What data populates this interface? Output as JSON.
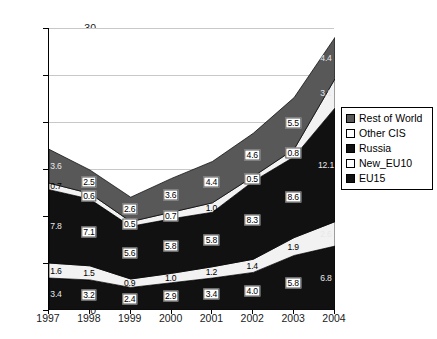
{
  "chart_data": {
    "type": "area",
    "stacked": true,
    "title": "",
    "subtitle": "",
    "xlabel": "",
    "ylabel": "",
    "categories": [
      "1997",
      "1998",
      "1999",
      "2000",
      "2001",
      "2002",
      "2003",
      "2004"
    ],
    "ylim": [
      0,
      30
    ],
    "yticks": [
      0,
      5,
      10,
      15,
      20,
      25,
      30
    ],
    "grid": true,
    "legend_position": "right",
    "series": [
      {
        "name": "EU15",
        "color": "#111111",
        "values": [
          3.4,
          3.2,
          2.4,
          2.9,
          3.4,
          4.0,
          5.8,
          6.8
        ]
      },
      {
        "name": "New_EU10",
        "color": "#f2f2f2",
        "values": [
          1.6,
          1.5,
          0.9,
          1.0,
          1.2,
          1.4,
          1.9,
          2.6
        ]
      },
      {
        "name": "Russia",
        "color": "#111111",
        "values": [
          7.8,
          7.1,
          5.6,
          5.8,
          5.8,
          8.3,
          8.6,
          12.1
        ]
      },
      {
        "name": "Other CIS",
        "color": "#f2f2f2",
        "values": [
          0.7,
          0.6,
          0.5,
          0.7,
          1.0,
          0.5,
          0.8,
          3.1
        ]
      },
      {
        "name": "Rest of World",
        "color": "#585858",
        "values": [
          3.6,
          2.5,
          2.6,
          3.6,
          4.4,
          4.6,
          5.5,
          4.4
        ]
      }
    ],
    "labels": [
      {
        "series": "Rest of World",
        "category": "1997",
        "text": "3.6",
        "style": "plain-light"
      },
      {
        "series": "Rest of World",
        "category": "1998",
        "text": "2.5",
        "style": "boxed"
      },
      {
        "series": "Rest of World",
        "category": "1999",
        "text": "2.6",
        "style": "boxed"
      },
      {
        "series": "Rest of World",
        "category": "2000",
        "text": "3.6",
        "style": "boxed"
      },
      {
        "series": "Rest of World",
        "category": "2001",
        "text": "4.4",
        "style": "boxed"
      },
      {
        "series": "Rest of World",
        "category": "2002",
        "text": "4.6",
        "style": "boxed"
      },
      {
        "series": "Rest of World",
        "category": "2003",
        "text": "5.5",
        "style": "boxed"
      },
      {
        "series": "Rest of World",
        "category": "2004",
        "text": "4.4",
        "style": "plain-light"
      },
      {
        "series": "Other CIS",
        "category": "1997",
        "text": "0.7",
        "style": "plain-dark"
      },
      {
        "series": "Other CIS",
        "category": "1998",
        "text": "0.6",
        "style": "boxed"
      },
      {
        "series": "Other CIS",
        "category": "1999",
        "text": "0.5",
        "style": "boxed"
      },
      {
        "series": "Other CIS",
        "category": "2000",
        "text": "0.7",
        "style": "boxed"
      },
      {
        "series": "Other CIS",
        "category": "2001",
        "text": "1.0",
        "style": "plain-dark"
      },
      {
        "series": "Other CIS",
        "category": "2002",
        "text": "0.5",
        "style": "boxed"
      },
      {
        "series": "Other CIS",
        "category": "2003",
        "text": "0.8",
        "style": "boxed"
      },
      {
        "series": "Other CIS",
        "category": "2004",
        "text": "3.1",
        "style": "plain-light"
      },
      {
        "series": "Russia",
        "category": "1997",
        "text": "7.8",
        "style": "plain-light"
      },
      {
        "series": "Russia",
        "category": "1998",
        "text": "7.1",
        "style": "boxed"
      },
      {
        "series": "Russia",
        "category": "1999",
        "text": "5.6",
        "style": "boxed"
      },
      {
        "series": "Russia",
        "category": "2000",
        "text": "5.8",
        "style": "boxed"
      },
      {
        "series": "Russia",
        "category": "2001",
        "text": "5.8",
        "style": "boxed"
      },
      {
        "series": "Russia",
        "category": "2002",
        "text": "8.3",
        "style": "boxed"
      },
      {
        "series": "Russia",
        "category": "2003",
        "text": "8.6",
        "style": "boxed"
      },
      {
        "series": "Russia",
        "category": "2004",
        "text": "12.1",
        "style": "plain-light"
      },
      {
        "series": "New_EU10",
        "category": "1997",
        "text": "1.6",
        "style": "plain-dark"
      },
      {
        "series": "New_EU10",
        "category": "1998",
        "text": "1.5",
        "style": "plain-dark"
      },
      {
        "series": "New_EU10",
        "category": "1999",
        "text": "0.9",
        "style": "plain-dark"
      },
      {
        "series": "New_EU10",
        "category": "2000",
        "text": "1.0",
        "style": "plain-dark"
      },
      {
        "series": "New_EU10",
        "category": "2001",
        "text": "1.2",
        "style": "plain-dark"
      },
      {
        "series": "New_EU10",
        "category": "2002",
        "text": "1.4",
        "style": "plain-dark"
      },
      {
        "series": "New_EU10",
        "category": "2003",
        "text": "1.9",
        "style": "plain-dark"
      },
      {
        "series": "New_EU10",
        "category": "2004",
        "text": "2.6",
        "style": "plain-light"
      },
      {
        "series": "EU15",
        "category": "1997",
        "text": "3.4",
        "style": "plain-light"
      },
      {
        "series": "EU15",
        "category": "1998",
        "text": "3.2",
        "style": "boxed"
      },
      {
        "series": "EU15",
        "category": "1999",
        "text": "2.4",
        "style": "boxed"
      },
      {
        "series": "EU15",
        "category": "2000",
        "text": "2.9",
        "style": "boxed"
      },
      {
        "series": "EU15",
        "category": "2001",
        "text": "3.4",
        "style": "boxed"
      },
      {
        "series": "EU15",
        "category": "2002",
        "text": "4.0",
        "style": "boxed"
      },
      {
        "series": "EU15",
        "category": "2003",
        "text": "5.8",
        "style": "boxed"
      },
      {
        "series": "EU15",
        "category": "2004",
        "text": "6.8",
        "style": "plain-light"
      }
    ]
  },
  "legend": {
    "items": [
      {
        "label": "Rest of World",
        "color": "#585858"
      },
      {
        "label": "Other CIS",
        "color": "#ffffff"
      },
      {
        "label": "Russia",
        "color": "#111111"
      },
      {
        "label": "New_EU10",
        "color": "#ffffff"
      },
      {
        "label": "EU15",
        "color": "#111111"
      }
    ]
  }
}
